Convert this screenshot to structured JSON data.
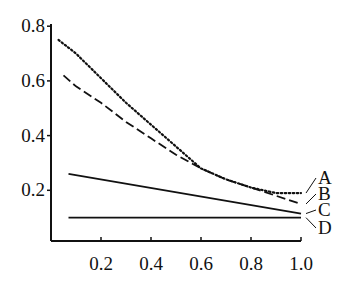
{
  "chart_data": {
    "type": "line",
    "title": "",
    "xlabel": "",
    "ylabel": "",
    "xlim": [
      0.0,
      1.0
    ],
    "ylim": [
      0.0,
      0.8
    ],
    "grid": false,
    "legend": "inline labels at right end of lines",
    "x_ticks": [
      "0.2",
      "0.4",
      "0.6",
      "0.8",
      "1.0"
    ],
    "y_ticks": [
      "0.2",
      "0.4",
      "0.6",
      "0.8"
    ],
    "series": [
      {
        "name": "A",
        "style": "dotted",
        "x": [
          0.03,
          0.1,
          0.2,
          0.3,
          0.4,
          0.5,
          0.6,
          0.7,
          0.8,
          0.9,
          1.0
        ],
        "y": [
          0.75,
          0.7,
          0.61,
          0.52,
          0.44,
          0.36,
          0.28,
          0.24,
          0.21,
          0.19,
          0.19
        ]
      },
      {
        "name": "B",
        "style": "dashed",
        "x": [
          0.05,
          0.1,
          0.2,
          0.3,
          0.4,
          0.5,
          0.6,
          0.7,
          0.8,
          0.9,
          1.0
        ],
        "y": [
          0.62,
          0.58,
          0.52,
          0.45,
          0.39,
          0.33,
          0.28,
          0.24,
          0.21,
          0.18,
          0.15
        ]
      },
      {
        "name": "C",
        "style": "solid",
        "x": [
          0.07,
          1.0
        ],
        "y": [
          0.26,
          0.115
        ]
      },
      {
        "name": "D",
        "style": "solid",
        "x": [
          0.07,
          1.0
        ],
        "y": [
          0.1,
          0.1
        ]
      }
    ]
  }
}
